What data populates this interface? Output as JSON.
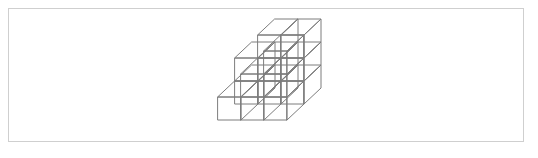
{
  "figure": {
    "kind": "isometric-block-diagram",
    "background_color": "#ffffff",
    "frame": {
      "border_color": "#cfcfcf",
      "border_width": 1,
      "x": 8,
      "y": 8,
      "width": 516,
      "height": 134
    },
    "drawing": {
      "line_color": "#7d7d7d",
      "line_width": 1,
      "face_color": "#ffffff",
      "projection": "isometric",
      "origin_x": 252,
      "origin_y": 19,
      "cell_width": 23,
      "cell_height": 23,
      "depth_dx": -17,
      "depth_dy": 16,
      "grid_columns": 3,
      "grid_rows": 2,
      "grid_levels": 3,
      "description": "Stepped stack of unit cubes, three wide, two deep and three tall, terracing down from the back right toward the front left.",
      "heights": [
        [
          2,
          3,
          3
        ],
        [
          1,
          2,
          3
        ]
      ]
    }
  }
}
